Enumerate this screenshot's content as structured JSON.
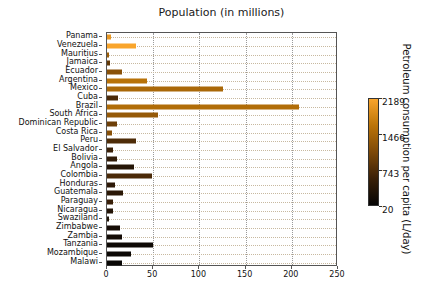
{
  "chart_data": {
    "type": "bar",
    "orientation": "horizontal",
    "title": "Population (in millions)",
    "xlabel": "",
    "ylabel": "",
    "xlim": [
      0,
      250
    ],
    "xticks": [
      0,
      50,
      100,
      150,
      200,
      250
    ],
    "grid": true,
    "categories": [
      "Panama",
      "Venezuela",
      "Mauritius",
      "Jamaica",
      "Ecuador",
      "Argentina",
      "Mexico",
      "Cuba",
      "Brazil",
      "South Africa",
      "Dominican Republic",
      "Costa Rica",
      "Peru",
      "El Salvador",
      "Bolivia",
      "Angola",
      "Colombia",
      "Honduras",
      "Guatemala",
      "Paraguay",
      "Nicaragua",
      "Swaziland",
      "Zimbabwe",
      "Zambia",
      "Tanzania",
      "Mozambique",
      "Malawi"
    ],
    "values": [
      4.0,
      31.0,
      1.3,
      2.9,
      16.1,
      43.4,
      126.0,
      11.4,
      208.0,
      55.0,
      10.5,
      4.9,
      31.8,
      6.4,
      11.0,
      29.0,
      49.0,
      9.0,
      16.9,
      6.8,
      6.2,
      1.1,
      14.0,
      16.6,
      50.0,
      26.0,
      16.0
    ],
    "colorvalues": [
      2050,
      2189,
      1380,
      890,
      1200,
      1620,
      1500,
      700,
      1560,
      1320,
      980,
      1200,
      720,
      560,
      480,
      360,
      700,
      430,
      410,
      540,
      330,
      280,
      190,
      170,
      110,
      90,
      60
    ],
    "colorbar": {
      "label": "Petroleum consumption per capita (L/day)",
      "ticks": [
        2189,
        1466,
        743,
        20
      ],
      "vmin": 20,
      "vmax": 2189,
      "colormap": "copper-afmhot",
      "stops": [
        "#050505",
        "#3a2008",
        "#7e4908",
        "#bb7408",
        "#f9a52c"
      ]
    },
    "colors": {
      "axis": "#555555",
      "text": "#111111",
      "vertical_grid": "#9a9a9a",
      "horizontal_grid": "#c8b9a0",
      "background": "#ffffff"
    }
  }
}
